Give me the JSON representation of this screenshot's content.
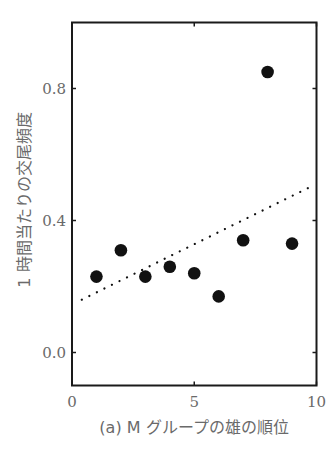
{
  "chart_data": {
    "type": "scatter",
    "title": "",
    "xlabel": "(a) M グループの雄の順位",
    "ylabel": "1 時間当たりの交尾頻度",
    "xlim": [
      0,
      10
    ],
    "ylim": [
      -0.1,
      1.0
    ],
    "xticks": [
      0,
      5,
      10
    ],
    "xtick_labels": [
      "0",
      "5",
      "10"
    ],
    "yticks": [
      0.0,
      0.4,
      0.8
    ],
    "ytick_labels": [
      "0.0",
      "0.4",
      "0.8"
    ],
    "grid": false,
    "legend": null,
    "series": [
      {
        "name": "males",
        "marker": "filled-circle",
        "color": "#111111",
        "x": [
          1,
          2,
          3,
          4,
          5,
          6,
          7,
          8,
          9
        ],
        "y": [
          0.23,
          0.31,
          0.23,
          0.26,
          0.24,
          0.17,
          0.34,
          0.85,
          0.33
        ]
      }
    ],
    "trendline": {
      "style": "dotted",
      "color": "#111111",
      "x": [
        0.4,
        9.7
      ],
      "y": [
        0.16,
        0.5
      ]
    }
  },
  "colors": {
    "frame": "#1a1a1a",
    "text": "#6a6a6a",
    "marker": "#111111"
  }
}
